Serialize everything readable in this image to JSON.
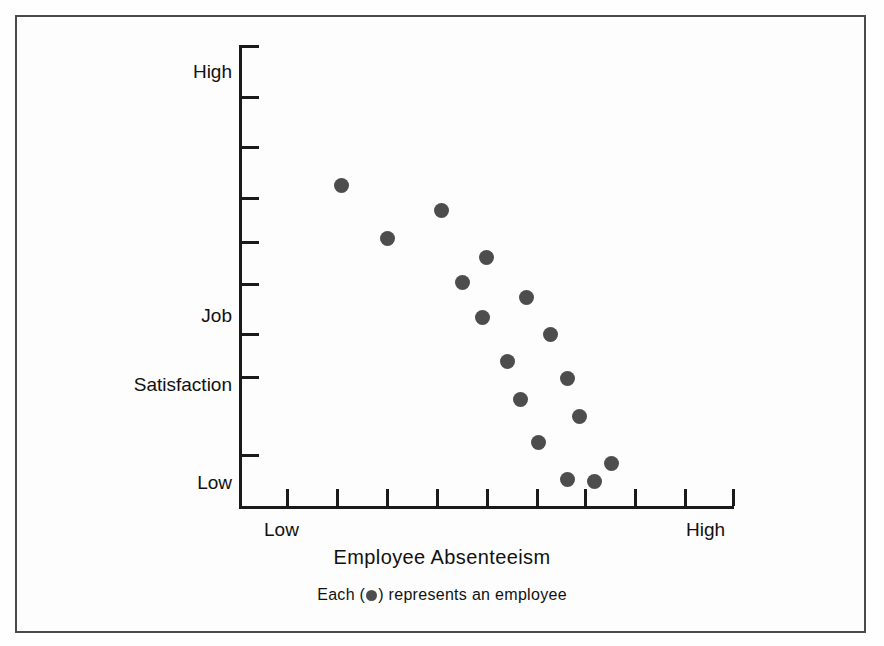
{
  "figure": {
    "background_color": "#fdfdfd",
    "frame_color": "#4a4a4a",
    "ink_color": "#1a1a1a",
    "marker_color": "#4d4d4d"
  },
  "labels": {
    "y_high": "High",
    "y_low": "Low",
    "y_title_line1": "Job",
    "y_title_line2": "Satisfaction",
    "x_low": "Low",
    "x_high": "High",
    "x_title": "Employee Absenteeism",
    "caption_before": "Each  (",
    "caption_after": ")  represents an employee"
  },
  "chart_data": {
    "type": "scatter",
    "title": "",
    "xlabel": "Employee Absenteeism",
    "ylabel": "Job Satisfaction",
    "xlim": [
      0,
      10
    ],
    "ylim": [
      0,
      9
    ],
    "grid": false,
    "legend": "none",
    "annotation": "Each ( ● ) represents an employee",
    "x_tick_labels": [
      "Low",
      "",
      "",
      "",
      "",
      "",
      "",
      "",
      "",
      "",
      "High"
    ],
    "y_tick_labels": [
      "Low",
      "",
      "",
      "",
      "",
      "",
      "",
      "",
      "High"
    ],
    "x_tick_count": 11,
    "y_tick_count": 9,
    "marker": "filled-circle",
    "marker_color": "#4d4d4d",
    "point_count": 17,
    "points_px": [
      {
        "x": 341,
        "y": 185
      },
      {
        "x": 387,
        "y": 238
      },
      {
        "x": 441,
        "y": 210
      },
      {
        "x": 486,
        "y": 257
      },
      {
        "x": 462,
        "y": 282
      },
      {
        "x": 526,
        "y": 297
      },
      {
        "x": 482,
        "y": 317
      },
      {
        "x": 550,
        "y": 334
      },
      {
        "x": 507,
        "y": 361
      },
      {
        "x": 567,
        "y": 378
      },
      {
        "x": 520,
        "y": 399
      },
      {
        "x": 579,
        "y": 416
      },
      {
        "x": 538,
        "y": 442
      },
      {
        "x": 611,
        "y": 463
      },
      {
        "x": 567,
        "y": 479
      },
      {
        "x": 594,
        "y": 481
      }
    ],
    "points_data": [
      {
        "absenteeism": 2.04,
        "satisfaction": 6.29
      },
      {
        "absenteeism": 2.98,
        "satisfaction": 5.25
      },
      {
        "absenteeism": 4.07,
        "satisfaction": 5.8
      },
      {
        "absenteeism": 4.98,
        "satisfaction": 4.88
      },
      {
        "absenteeism": 4.49,
        "satisfaction": 4.39
      },
      {
        "absenteeism": 5.79,
        "satisfaction": 4.1
      },
      {
        "absenteeism": 4.9,
        "satisfaction": 3.71
      },
      {
        "absenteeism": 6.28,
        "satisfaction": 3.37
      },
      {
        "absenteeism": 5.41,
        "satisfaction": 2.84
      },
      {
        "absenteeism": 6.63,
        "satisfaction": 2.51
      },
      {
        "absenteeism": 5.67,
        "satisfaction": 2.1
      },
      {
        "absenteeism": 6.87,
        "satisfaction": 1.77
      },
      {
        "absenteeism": 6.04,
        "satisfaction": 1.26
      },
      {
        "absenteeism": 7.52,
        "satisfaction": 0.85
      },
      {
        "absenteeism": 6.63,
        "satisfaction": 0.54
      },
      {
        "absenteeism": 7.18,
        "satisfaction": 0.5
      }
    ],
    "y_ticks_px": [
      46,
      97,
      147,
      198,
      242,
      284,
      334,
      377,
      455
    ],
    "x_ticks_px": [
      240,
      287,
      337,
      387,
      437,
      487,
      537,
      585,
      635,
      685,
      733
    ]
  }
}
